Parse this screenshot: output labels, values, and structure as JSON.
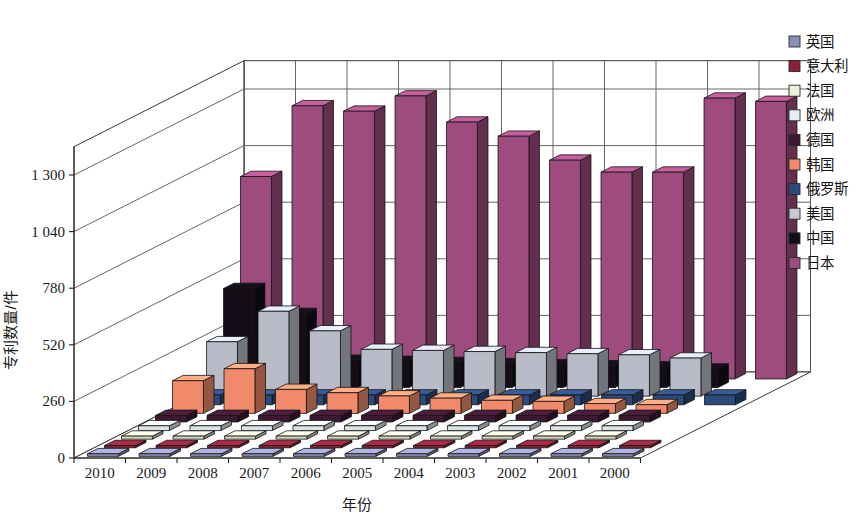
{
  "chart_data": {
    "type": "bar",
    "subtype": "3d-grouped-bar",
    "title": "",
    "xlabel": "年份",
    "ylabel": "专利数量/件",
    "ylim": [
      0,
      1430
    ],
    "yticks": [
      0,
      260,
      520,
      780,
      1040,
      1300
    ],
    "ytick_labels": [
      "0",
      "260",
      "520",
      "780",
      "1 040",
      "1 300"
    ],
    "grid": true,
    "legend_position": "right",
    "categories": [
      "2010",
      "2009",
      "2008",
      "2007",
      "2006",
      "2005",
      "2004",
      "2003",
      "2002",
      "2001",
      "2000"
    ],
    "series": [
      {
        "name": "英国",
        "color": "#8b8fb5",
        "values": [
          12,
          12,
          12,
          12,
          12,
          12,
          12,
          12,
          12,
          12,
          12
        ]
      },
      {
        "name": "意大利",
        "color": "#8e2038",
        "values": [
          10,
          10,
          10,
          10,
          10,
          10,
          10,
          10,
          10,
          10,
          10
        ]
      },
      {
        "name": "法国",
        "color": "#d9dbbf",
        "values": [
          14,
          14,
          14,
          14,
          14,
          14,
          14,
          14,
          14,
          14,
          0
        ]
      },
      {
        "name": "欧洲",
        "color": "#dbe4e8",
        "values": [
          22,
          22,
          22,
          22,
          22,
          22,
          22,
          22,
          22,
          22,
          0
        ]
      },
      {
        "name": "德国",
        "color": "#3e1733",
        "values": [
          30,
          30,
          30,
          30,
          30,
          30,
          30,
          30,
          30,
          30,
          0
        ]
      },
      {
        "name": "韩国",
        "color": "#f08a6a",
        "values": [
          150,
          205,
          110,
          95,
          80,
          70,
          60,
          55,
          45,
          40,
          0
        ]
      },
      {
        "name": "俄罗斯",
        "color": "#2c4a7c",
        "values": [
          45,
          45,
          45,
          45,
          45,
          45,
          45,
          45,
          45,
          45,
          45
        ]
      },
      {
        "name": "美国",
        "color": "#b9bcc8",
        "values": [
          250,
          390,
          300,
          215,
          210,
          205,
          200,
          195,
          190,
          175,
          0
        ]
      },
      {
        "name": "中国",
        "color": "#140d18",
        "values": [
          455,
          340,
          125,
          120,
          115,
          110,
          105,
          100,
          95,
          85,
          0
        ]
      },
      {
        "name": "日本",
        "color": "#9e4b7e",
        "values": [
          930,
          1255,
          1230,
          1300,
          1180,
          1115,
          1005,
          950,
          950,
          1290,
          1275
        ]
      }
    ]
  },
  "legend": {
    "items": [
      {
        "label": "英国",
        "color": "#8b8fb5"
      },
      {
        "label": "意大利",
        "color": "#8e2038"
      },
      {
        "label": "法国",
        "color": "#eff0d8"
      },
      {
        "label": "欧洲",
        "color": "#e6eef2"
      },
      {
        "label": "德国",
        "color": "#3e1733"
      },
      {
        "label": "韩国",
        "color": "#f08a6a"
      },
      {
        "label": "俄罗斯",
        "color": "#2c4a7c"
      },
      {
        "label": "美国",
        "color": "#c6c9d3"
      },
      {
        "label": "中国",
        "color": "#140d18"
      },
      {
        "label": "日本",
        "color": "#9e4b7e"
      }
    ]
  }
}
